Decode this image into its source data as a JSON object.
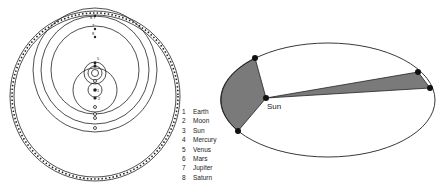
{
  "left_diagram": {
    "title": "Tychonic geocentric model",
    "legend": [
      {
        "num": "1",
        "label": "Earth"
      },
      {
        "num": "2",
        "label": "Moon"
      },
      {
        "num": "3",
        "label": "Sun"
      },
      {
        "num": "4",
        "label": "Mercury"
      },
      {
        "num": "5",
        "label": "Venus"
      },
      {
        "num": "6",
        "label": "Mars"
      },
      {
        "num": "7",
        "label": "Jupiter"
      },
      {
        "num": "8",
        "label": "Saturn"
      }
    ]
  },
  "right_diagram": {
    "title": "Kepler's second law ellipse",
    "sun_label": "Sun",
    "fill_color": "#7a7a7a"
  }
}
